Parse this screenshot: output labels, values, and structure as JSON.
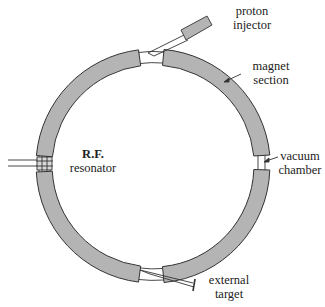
{
  "diagram": {
    "colors": {
      "magnet_fill": "#b4b4b4",
      "stroke": "#333333",
      "background": "#ffffff",
      "text": "#222222"
    },
    "labels": {
      "proton_injector": {
        "line1": "proton",
        "line2": "injector"
      },
      "magnet_section": {
        "line1": "magnet",
        "line2": "section"
      },
      "vacuum_chamber": {
        "line1": "vacuum",
        "line2": "chamber"
      },
      "rf_resonator": {
        "line1": "R.F.",
        "line2": "resonator"
      },
      "external_target": {
        "line1": "external",
        "line2": "target"
      }
    },
    "components": [
      "magnet-section-top-left",
      "magnet-section-top-right",
      "magnet-section-bottom-left",
      "magnet-section-bottom-right",
      "proton-injector",
      "rf-resonator",
      "vacuum-chamber",
      "external-target"
    ]
  }
}
